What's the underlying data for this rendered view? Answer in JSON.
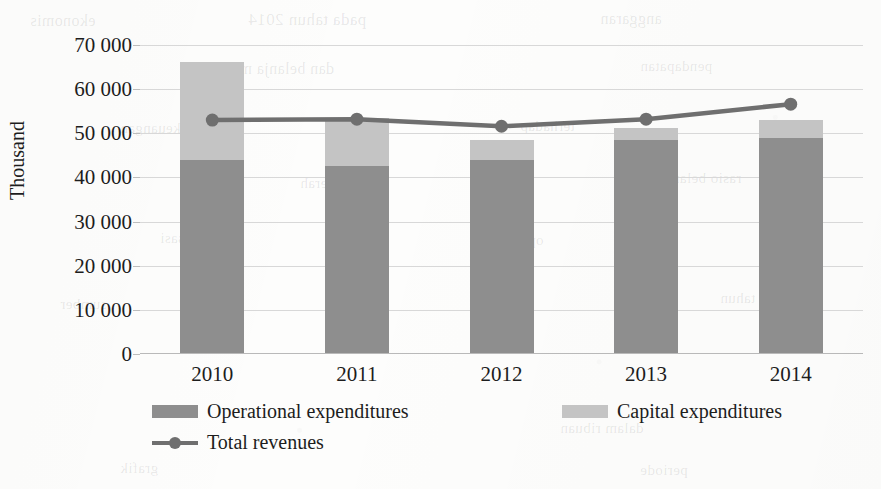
{
  "chart_data": {
    "type": "bar",
    "subtype": "stacked-bar-with-line-overlay",
    "title": "",
    "xlabel": "",
    "ylabel": "Thousand",
    "categories": [
      "2010",
      "2011",
      "2012",
      "2013",
      "2014"
    ],
    "ylim": [
      0,
      70000
    ],
    "ytick_step": 10000,
    "ytick_labels": [
      "70 000",
      "60 000",
      "50 000",
      "40 000",
      "30 000",
      "20 000",
      "10 000",
      "0"
    ],
    "ytick_values": [
      70000,
      60000,
      50000,
      40000,
      30000,
      20000,
      10000,
      0
    ],
    "grid": true,
    "grid_axis": "y",
    "legend_position": "bottom",
    "series": [
      {
        "name": "Operational expenditures",
        "type": "bar",
        "stack": "expenditures",
        "color": "#8e8e8e",
        "values": [
          43900,
          42600,
          43900,
          48500,
          48900
        ]
      },
      {
        "name": "Capital expenditures",
        "type": "bar",
        "stack": "expenditures",
        "color": "#c4c4c4",
        "values": [
          22200,
          10900,
          4600,
          2700,
          4100
        ]
      },
      {
        "name": "Total revenues",
        "type": "line",
        "color": "#6f6f6f",
        "marker": "circle",
        "values": [
          53000,
          53200,
          51600,
          53200,
          56600
        ]
      }
    ],
    "stack_totals": [
      66100,
      53500,
      48500,
      51200,
      53000
    ]
  },
  "axes": {
    "y_title": "Thousand"
  },
  "legend": {
    "items": [
      {
        "label": "Operational expenditures",
        "symbol": "swatch",
        "color": "#8e8e8e"
      },
      {
        "label": "Capital expenditures",
        "symbol": "swatch",
        "color": "#c4c4c4"
      },
      {
        "label": "Total revenues",
        "symbol": "line-marker",
        "color": "#6f6f6f"
      }
    ]
  },
  "background_bleed": [
    {
      "text": "ekonomis",
      "x": 30,
      "y": 12,
      "size": 16
    },
    {
      "text": "pada tahun 2014",
      "x": 248,
      "y": 10,
      "size": 17
    },
    {
      "text": "anggaran",
      "x": 600,
      "y": 10,
      "size": 16
    },
    {
      "text": "dan belanja modal",
      "x": 210,
      "y": 60,
      "size": 16
    },
    {
      "text": "pendapatan",
      "x": 640,
      "y": 58,
      "size": 15
    },
    {
      "text": "keuangan",
      "x": 120,
      "y": 120,
      "size": 15
    },
    {
      "text": "terhadap",
      "x": 520,
      "y": 118,
      "size": 15
    },
    {
      "text": "daerah",
      "x": 300,
      "y": 175,
      "size": 15
    },
    {
      "text": "rasio belanja",
      "x": 660,
      "y": 170,
      "size": 15
    },
    {
      "text": "realisasi",
      "x": 160,
      "y": 230,
      "size": 15
    },
    {
      "text": "operasional",
      "x": 470,
      "y": 232,
      "size": 15
    },
    {
      "text": "tahun",
      "x": 720,
      "y": 290,
      "size": 15
    },
    {
      "text": "sumber",
      "x": 60,
      "y": 296,
      "size": 15
    },
    {
      "text": "laporan",
      "x": 330,
      "y": 300,
      "size": 15
    },
    {
      "text": "dalam ribuan",
      "x": 560,
      "y": 420,
      "size": 15
    },
    {
      "text": "grafik",
      "x": 120,
      "y": 460,
      "size": 15
    },
    {
      "text": "periode",
      "x": 640,
      "y": 462,
      "size": 15
    }
  ]
}
